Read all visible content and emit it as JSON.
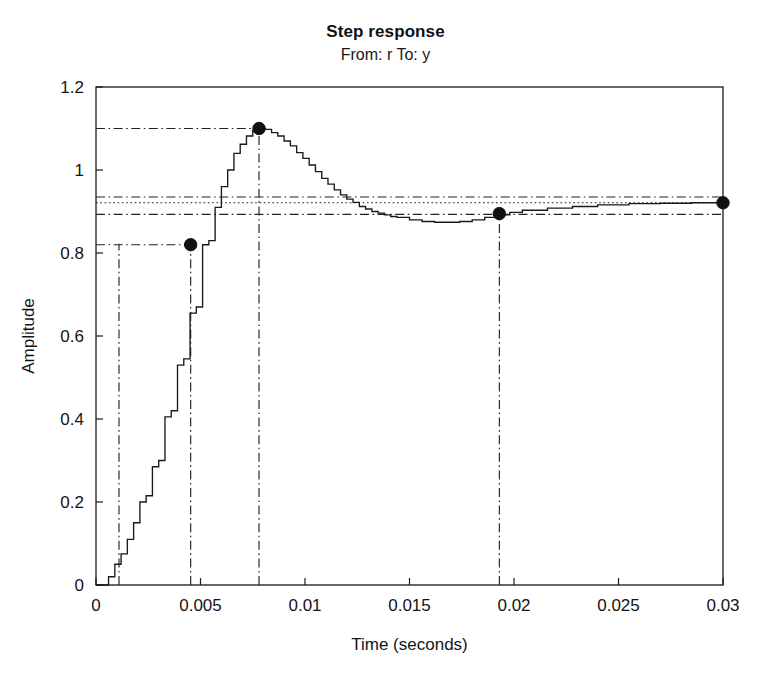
{
  "figure": {
    "title": "Step response",
    "subtitle": "From: r To: y",
    "width": 771,
    "height": 677
  },
  "chart_data": {
    "type": "line",
    "title": "Step response",
    "subtitle": "From: r To: y",
    "xlabel": "Time (seconds)",
    "ylabel": "Amplitude",
    "xlim": [
      0,
      0.03
    ],
    "ylim": [
      0,
      1.2
    ],
    "xticks": [
      0,
      0.005,
      0.01,
      0.015,
      0.02,
      0.025,
      0.03
    ],
    "xtick_labels": [
      "0",
      "0.005",
      "0.01",
      "0.015",
      "0.02",
      "0.025",
      "0.03"
    ],
    "yticks": [
      0,
      0.2,
      0.4,
      0.6,
      0.8,
      1,
      1.2
    ],
    "ytick_labels": [
      "0",
      "0.2",
      "0.4",
      "0.6",
      "0.8",
      "1",
      "1.2"
    ],
    "grid": false,
    "legend": null,
    "line_color": "#1a1a1a",
    "marker_color": "#111111",
    "guide_color": "#222222",
    "drawstyle": "steps-post",
    "series": [
      {
        "name": "step response y(t)",
        "x": [
          0.0,
          0.0003,
          0.0006,
          0.0009,
          0.0012,
          0.0015,
          0.0018,
          0.0021,
          0.0024,
          0.0027,
          0.003,
          0.0033,
          0.0036,
          0.0039,
          0.0042,
          0.0045,
          0.0048,
          0.0051,
          0.0054,
          0.0057,
          0.006,
          0.0063,
          0.0066,
          0.0069,
          0.0072,
          0.0075,
          0.0078,
          0.0081,
          0.0084,
          0.0087,
          0.009,
          0.0093,
          0.0096,
          0.0099,
          0.0102,
          0.0105,
          0.0108,
          0.0111,
          0.0114,
          0.0117,
          0.012,
          0.0123,
          0.0126,
          0.0129,
          0.0132,
          0.0135,
          0.0138,
          0.0141,
          0.0144,
          0.015,
          0.0156,
          0.0162,
          0.0168,
          0.0174,
          0.018,
          0.0186,
          0.0192,
          0.0198,
          0.0204,
          0.0216,
          0.0228,
          0.024,
          0.0255,
          0.027,
          0.0285,
          0.03
        ],
        "y": [
          0.0,
          0.0,
          0.02,
          0.05,
          0.075,
          0.11,
          0.15,
          0.2,
          0.215,
          0.285,
          0.3,
          0.405,
          0.42,
          0.53,
          0.545,
          0.655,
          0.67,
          0.82,
          0.83,
          0.91,
          0.96,
          1.0,
          1.04,
          1.062,
          1.082,
          1.095,
          1.1,
          1.098,
          1.09,
          1.082,
          1.07,
          1.058,
          1.042,
          1.028,
          1.012,
          0.996,
          0.98,
          0.966,
          0.952,
          0.94,
          0.93,
          0.922,
          0.912,
          0.906,
          0.9,
          0.896,
          0.892,
          0.888,
          0.886,
          0.88,
          0.876,
          0.874,
          0.874,
          0.876,
          0.88,
          0.886,
          0.892,
          0.898,
          0.903,
          0.908,
          0.912,
          0.916,
          0.919,
          0.92,
          0.921,
          0.921
        ]
      }
    ],
    "markers": [
      {
        "name": "rise-time-marker",
        "x": 0.00453,
        "y": 0.82
      },
      {
        "name": "peak-marker",
        "x": 0.0078,
        "y": 1.1
      },
      {
        "name": "settling-time-marker",
        "x": 0.0193,
        "y": 0.895
      },
      {
        "name": "final-value-marker",
        "x": 0.03,
        "y": 0.921
      }
    ],
    "hlines": [
      {
        "name": "peak-level-line",
        "y": 1.1,
        "style": "dashdot",
        "x_start": 0.0,
        "x_end": 0.008
      },
      {
        "name": "settling-upper-band-line",
        "y": 0.935,
        "style": "dashdot",
        "x_start": 0.0,
        "x_end": 0.03
      },
      {
        "name": "final-value-line",
        "y": 0.921,
        "style": "dotted",
        "x_start": 0.0,
        "x_end": 0.03
      },
      {
        "name": "settling-lower-band-line",
        "y": 0.893,
        "style": "dashdot",
        "x_start": 0.0,
        "x_end": 0.03
      },
      {
        "name": "rise-time-level-line",
        "y": 0.82,
        "style": "dashdot",
        "x_start": 0.0,
        "x_end": 0.0046
      }
    ],
    "vlines": [
      {
        "name": "delay-time-line",
        "x": 0.0011,
        "style": "dashdot",
        "y_start": 0.0,
        "y_end": 0.822
      },
      {
        "name": "rise-time-line",
        "x": 0.00453,
        "style": "dashdot",
        "y_start": 0.0,
        "y_end": 0.822
      },
      {
        "name": "peak-time-line",
        "x": 0.0078,
        "style": "dashdot",
        "y_start": 0.0,
        "y_end": 1.1
      },
      {
        "name": "settling-time-line",
        "x": 0.0193,
        "style": "dashdot",
        "y_start": 0.0,
        "y_end": 0.895
      }
    ],
    "annotations": []
  }
}
